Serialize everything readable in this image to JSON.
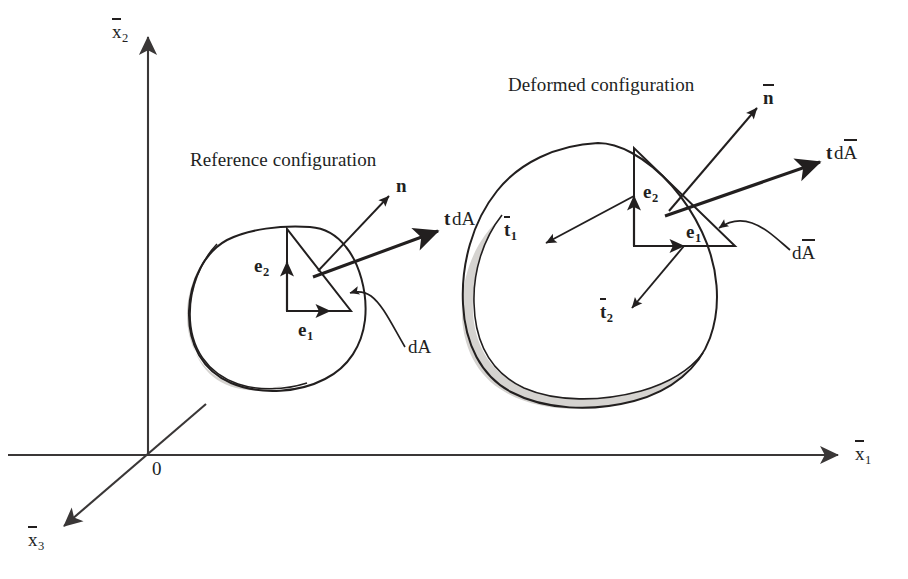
{
  "figure": {
    "kind": "continuum-mechanics-traction-diagram",
    "background_color": "#ffffff",
    "ink_color": "#221f1f",
    "shading_color": "#d5d3d0",
    "width": 908,
    "height": 579
  },
  "axes": {
    "vertical_label": "x",
    "vertical_subscript": "2",
    "horizontal_label": "x",
    "horizontal_subscript": "1",
    "depth_label": "x",
    "depth_subscript": "3",
    "origin_label": "0"
  },
  "panels": {
    "reference": {
      "title": "Reference configuration",
      "basis_1": "e",
      "basis_1_subscript": "1",
      "basis_2": "e",
      "basis_2_subscript": "2",
      "normal": "n",
      "traction_bold": "t",
      "traction_area": "dA",
      "area_leader": "dA"
    },
    "deformed": {
      "title": "Deformed configuration",
      "basis_1": "e",
      "basis_1_subscript": "1",
      "basis_2": "e",
      "basis_2_subscript": "2",
      "normal": "n",
      "traction_bold": "t",
      "traction_area": "dA",
      "area_leader": "dA",
      "traction_1": "t",
      "traction_1_subscript": "1",
      "traction_2": "t",
      "traction_2_subscript": "2"
    }
  }
}
